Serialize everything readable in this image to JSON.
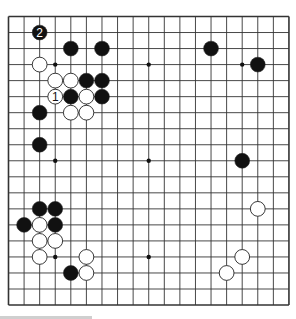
{
  "board": {
    "size": 19,
    "origin": {
      "x": 8.5,
      "y": 16.5
    },
    "spacing": {
      "x": 15.58,
      "y": 16.03
    },
    "stone_radius": 7.4,
    "line_color": "#333333",
    "board_color": "#ffffff",
    "black_color": "#111111",
    "white_fill": "#ffffff",
    "hoshi": [
      [
        3,
        3
      ],
      [
        9,
        3
      ],
      [
        15,
        3
      ],
      [
        3,
        9
      ],
      [
        9,
        9
      ],
      [
        15,
        9
      ],
      [
        3,
        15
      ],
      [
        9,
        15
      ],
      [
        15,
        15
      ]
    ]
  },
  "stones": [
    {
      "color": "black",
      "col": 2,
      "row": 1,
      "label": "2"
    },
    {
      "color": "black",
      "col": 4,
      "row": 2,
      "label": ""
    },
    {
      "color": "black",
      "col": 6,
      "row": 2,
      "label": ""
    },
    {
      "color": "black",
      "col": 13,
      "row": 2,
      "label": ""
    },
    {
      "color": "black",
      "col": 16,
      "row": 3,
      "label": ""
    },
    {
      "color": "white",
      "col": 2,
      "row": 3,
      "label": ""
    },
    {
      "color": "white",
      "col": 3,
      "row": 4,
      "label": ""
    },
    {
      "color": "white",
      "col": 4,
      "row": 4,
      "label": ""
    },
    {
      "color": "black",
      "col": 5,
      "row": 4,
      "label": ""
    },
    {
      "color": "black",
      "col": 6,
      "row": 4,
      "label": ""
    },
    {
      "color": "white",
      "col": 3,
      "row": 5,
      "label": "1"
    },
    {
      "color": "black",
      "col": 4,
      "row": 5,
      "label": ""
    },
    {
      "color": "white",
      "col": 5,
      "row": 5,
      "label": ""
    },
    {
      "color": "black",
      "col": 6,
      "row": 5,
      "label": ""
    },
    {
      "color": "black",
      "col": 2,
      "row": 6,
      "label": ""
    },
    {
      "color": "white",
      "col": 4,
      "row": 6,
      "label": ""
    },
    {
      "color": "white",
      "col": 5,
      "row": 6,
      "label": ""
    },
    {
      "color": "black",
      "col": 2,
      "row": 8,
      "label": ""
    },
    {
      "color": "black",
      "col": 15,
      "row": 9,
      "label": ""
    },
    {
      "color": "black",
      "col": 2,
      "row": 12,
      "label": ""
    },
    {
      "color": "black",
      "col": 3,
      "row": 12,
      "label": ""
    },
    {
      "color": "white",
      "col": 16,
      "row": 12,
      "label": ""
    },
    {
      "color": "black",
      "col": 1,
      "row": 13,
      "label": ""
    },
    {
      "color": "white",
      "col": 2,
      "row": 13,
      "label": ""
    },
    {
      "color": "black",
      "col": 3,
      "row": 13,
      "label": ""
    },
    {
      "color": "white",
      "col": 2,
      "row": 14,
      "label": ""
    },
    {
      "color": "white",
      "col": 3,
      "row": 14,
      "label": ""
    },
    {
      "color": "white",
      "col": 2,
      "row": 15,
      "label": ""
    },
    {
      "color": "white",
      "col": 5,
      "row": 15,
      "label": ""
    },
    {
      "color": "white",
      "col": 15,
      "row": 15,
      "label": ""
    },
    {
      "color": "black",
      "col": 4,
      "row": 16,
      "label": ""
    },
    {
      "color": "white",
      "col": 5,
      "row": 16,
      "label": ""
    },
    {
      "color": "white",
      "col": 14,
      "row": 16,
      "label": ""
    }
  ]
}
